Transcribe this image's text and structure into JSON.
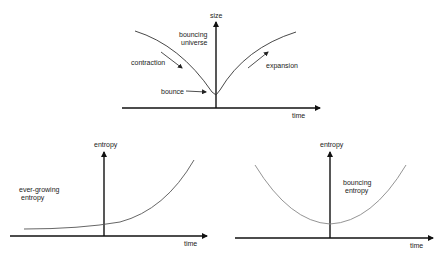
{
  "top": {
    "y_axis_label": "size",
    "x_axis_label": "time",
    "title_line1": "bouncing",
    "title_line2": "universe",
    "label_contraction": "contraction",
    "label_expansion": "expansion",
    "label_bounce": "bounce"
  },
  "bottom_left": {
    "y_axis_label": "entropy",
    "x_axis_label": "time",
    "label_line1": "ever-growing",
    "label_line2": "entropy"
  },
  "bottom_right": {
    "y_axis_label": "entropy",
    "x_axis_label": "time",
    "label_line1": "bouncing",
    "label_line2": "entropy"
  },
  "colors": {
    "axis": "#111111",
    "curve_dark": "#333333",
    "curve_light": "#888888"
  }
}
